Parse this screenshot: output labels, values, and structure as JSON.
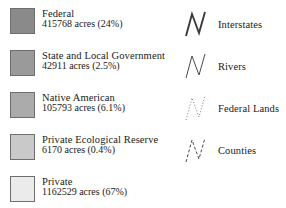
{
  "legend": {
    "polygon_entries": [
      {
        "label": "Federal",
        "stat": "415768 acres (24%)",
        "acres": 415768,
        "percent": "24%",
        "color": "#8a8a8a",
        "border_color": "#6e6e6e",
        "swatch_icon": "filled-square-icon"
      },
      {
        "label": "State and Local Government",
        "stat": "42911 acres (2.5%)",
        "acres": 42911,
        "percent": "2.5%",
        "color": "#9a9a9a",
        "border_color": "#6e6e6e",
        "swatch_icon": "filled-square-icon"
      },
      {
        "label": "Native American",
        "stat": "105793 acres (6.1%)",
        "acres": 105793,
        "percent": "6.1%",
        "color": "#ababab",
        "border_color": "#6e6e6e",
        "swatch_icon": "filled-square-icon"
      },
      {
        "label": "Private Ecological Reserve",
        "stat": "6170 acres (0.4%)",
        "acres": 6170,
        "percent": "0.4%",
        "color": "#c9c9c9",
        "border_color": "#6e6e6e",
        "swatch_icon": "filled-square-icon"
      },
      {
        "label": "Private",
        "stat": "1162529 acres (67%)",
        "acres": 1162529,
        "percent": "67%",
        "color": "#ebebeb",
        "border_color": "#6e6e6e",
        "swatch_icon": "filled-square-icon"
      }
    ],
    "line_entries": [
      {
        "label": "Interstates",
        "style": "solid",
        "width": 1.9,
        "dash": "none",
        "color": "#3a3a3a",
        "symbol_icon": "zigzag-line-icon"
      },
      {
        "label": "Rivers",
        "style": "solid",
        "width": 1.0,
        "dash": "none",
        "color": "#4a4a4a",
        "symbol_icon": "zigzag-line-icon"
      },
      {
        "label": "Federal Lands",
        "style": "dotted",
        "width": 1.0,
        "dash": "1 2",
        "color": "#7a7a7a",
        "symbol_icon": "zigzag-dotted-line-icon"
      },
      {
        "label": "Counties",
        "style": "dashed",
        "width": 1.0,
        "dash": "3 2",
        "color": "#4a4a4a",
        "symbol_icon": "zigzag-dashed-line-icon"
      }
    ]
  }
}
